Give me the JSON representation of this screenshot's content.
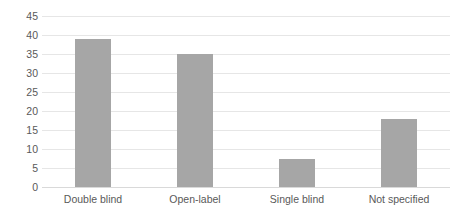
{
  "chart_data": {
    "type": "bar",
    "title": "",
    "subtitle": "",
    "xlabel": "",
    "ylabel": "",
    "categories": [
      "Double blind",
      "Open-label",
      "Single blind",
      "Not specified"
    ],
    "values": [
      39,
      35,
      7.5,
      18
    ],
    "series": [
      {
        "name": "Count",
        "values": [
          39,
          35,
          7.5,
          18
        ]
      }
    ],
    "ylim": [
      0,
      45
    ],
    "ytick_step": 5,
    "yticks": [
      0,
      5,
      10,
      15,
      20,
      25,
      30,
      35,
      40,
      45
    ],
    "ytick_labels": [
      "0",
      "5",
      "10",
      "15",
      "20",
      "25",
      "30",
      "35",
      "40",
      "45"
    ],
    "grid": true,
    "grid_axis": "y",
    "legend": false,
    "legend_position": "none",
    "bar_color": "#a6a6a6",
    "gridline_color": "#e6e6e6",
    "text_color": "#595959",
    "background_color": "#ffffff",
    "annotations": []
  }
}
